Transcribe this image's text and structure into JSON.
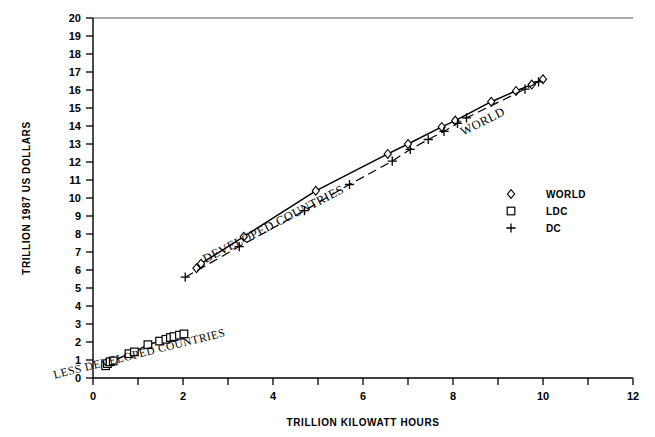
{
  "chart_data": {
    "type": "scatter",
    "title": "",
    "xlabel": "TRILLION KILOWATT HOURS",
    "ylabel": "TRILLION 1987 US DOLLARS",
    "xlim": [
      0,
      12
    ],
    "ylim": [
      0,
      20
    ],
    "xticks": [
      0,
      1,
      2,
      3,
      4,
      5,
      6,
      7,
      8,
      9,
      10,
      11,
      12
    ],
    "xtick_labels": [
      "0",
      "",
      "2",
      "",
      "4",
      "",
      "6",
      "",
      "8",
      "",
      "10",
      "",
      "12"
    ],
    "yticks": [
      0,
      1,
      2,
      3,
      4,
      5,
      6,
      7,
      8,
      9,
      10,
      11,
      12,
      13,
      14,
      15,
      16,
      17,
      18,
      19,
      20
    ],
    "ytick_labels": [
      "0",
      "1",
      "2",
      "3",
      "4",
      "5",
      "6",
      "7",
      "8",
      "9",
      "10",
      "11",
      "12",
      "13",
      "14",
      "15",
      "16",
      "17",
      "18",
      "19",
      "20"
    ],
    "grid": false,
    "legend_position": "right",
    "series": [
      {
        "name": "WORLD",
        "marker": "diamond",
        "line": "solid",
        "points": [
          [
            2.3,
            6.1
          ],
          [
            2.4,
            6.35
          ],
          [
            3.35,
            7.85
          ],
          [
            4.95,
            10.4
          ],
          [
            6.55,
            12.45
          ],
          [
            7.0,
            13.0
          ],
          [
            7.75,
            13.95
          ],
          [
            8.05,
            14.3
          ],
          [
            8.85,
            15.35
          ],
          [
            9.4,
            15.95
          ],
          [
            9.75,
            16.3
          ],
          [
            10.0,
            16.6
          ]
        ]
      },
      {
        "name": "LDC",
        "marker": "square",
        "line": "solid",
        "points": [
          [
            0.28,
            0.68
          ],
          [
            0.32,
            0.8
          ],
          [
            0.38,
            0.9
          ],
          [
            0.45,
            0.95
          ],
          [
            0.8,
            1.35
          ],
          [
            0.92,
            1.45
          ],
          [
            1.22,
            1.85
          ],
          [
            1.48,
            2.05
          ],
          [
            1.62,
            2.15
          ],
          [
            1.72,
            2.25
          ],
          [
            1.8,
            2.3
          ],
          [
            1.92,
            2.38
          ],
          [
            2.02,
            2.45
          ]
        ]
      },
      {
        "name": "DC",
        "marker": "plus",
        "line": "dashed",
        "points": [
          [
            2.05,
            5.6
          ],
          [
            3.25,
            7.3
          ],
          [
            4.7,
            9.3
          ],
          [
            5.7,
            10.75
          ],
          [
            6.65,
            12.05
          ],
          [
            7.05,
            12.7
          ],
          [
            7.45,
            13.25
          ],
          [
            7.8,
            13.7
          ],
          [
            8.1,
            14.15
          ],
          [
            8.3,
            14.45
          ],
          [
            9.6,
            16.05
          ],
          [
            9.9,
            16.45
          ]
        ]
      }
    ],
    "annotations": [
      {
        "text": "WORLD",
        "x": 8.7,
        "y": 14.05,
        "rotation": -27
      },
      {
        "text": "DEVELOPED COUNTRIES",
        "x": 4.05,
        "y": 8.35,
        "rotation": -27
      },
      {
        "text": "LESS DEVELOPED COUNTRIES",
        "x": 1.05,
        "y": 1.15,
        "rotation": -14
      }
    ],
    "legend_entries": [
      {
        "label": "WORLD",
        "marker": "diamond"
      },
      {
        "label": "LDC",
        "marker": "square"
      },
      {
        "label": "DC",
        "marker": "plus"
      }
    ]
  },
  "figure": {
    "caption": ""
  }
}
